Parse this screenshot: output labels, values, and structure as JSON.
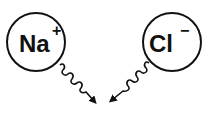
{
  "diagram": {
    "ions": [
      {
        "symbol": "Na",
        "charge": "+"
      },
      {
        "symbol": "Cl",
        "charge": "−"
      }
    ],
    "arrows": [
      {
        "from": "Na",
        "style": "wavy"
      },
      {
        "from": "Cl",
        "style": "wavy"
      }
    ],
    "colors": {
      "stroke": "#111111",
      "background": "#ffffff"
    }
  }
}
